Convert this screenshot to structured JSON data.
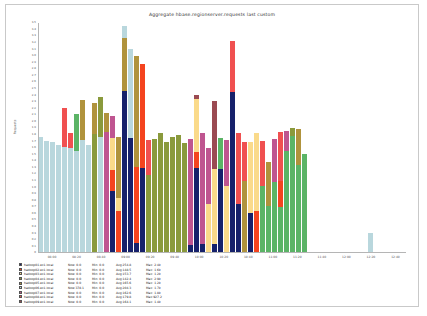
{
  "title": "Aggregate hbase.regionserver.requests last custom",
  "axes": {
    "ylabel": "Requests",
    "ylim": [
      0,
      3500
    ],
    "ytick_step": 100,
    "xticks": [
      "08:00",
      "08:20",
      "08:40",
      "09:00",
      "09:20",
      "09:40",
      "10:00",
      "10:20",
      "10:40",
      "11:00",
      "11:20",
      "11:40",
      "12:00",
      "12:20",
      "12:40"
    ]
  },
  "colors": {
    "navy": "#16216b",
    "orangered": "#f4441f",
    "cream": "#fada8a",
    "olive": "#8a9a3c",
    "khaki": "#b0933c",
    "powderblue": "#b9d7dd",
    "magenta": "#bf5590",
    "red": "#f05050",
    "maroon": "#9b4a52",
    "green": "#5bb466"
  },
  "legend": {
    "columns": [
      "host",
      "now",
      "min",
      "avg",
      "max"
    ],
    "rows": [
      {
        "color": "#16216b",
        "host": "hadoop01.ex1.local",
        "now": "Now:   0.0",
        "min": "Min:   0.0",
        "avg": "Avg:254.8",
        "max": "Max:  2.4k"
      },
      {
        "color": "#f4441f",
        "host": "hadoop02.ex1.local",
        "now": "Now:   0.0",
        "min": "Min:   0.0",
        "avg": "Avg:148.5",
        "max": "Max:  1.6k"
      },
      {
        "color": "#fada8a",
        "host": "hadoop03.ex1.local",
        "now": "Now:   0.0",
        "min": "Min:   0.0",
        "avg": "Avg:153.7",
        "max": "Max:  1.2k"
      },
      {
        "color": "#8a9a3c",
        "host": "hadoop04.ex1.local",
        "now": "Now:   0.0",
        "min": "Min:   0.0",
        "avg": "Avg:142.4",
        "max": "Max:  2.9k"
      },
      {
        "color": "#b0933c",
        "host": "hadoop05.ex1.local",
        "now": "Now:   0.0",
        "min": "Min:   0.0",
        "avg": "Avg:165.6",
        "max": "Max:  1.2k"
      },
      {
        "color": "#b9d7dd",
        "host": "hadoop06.ex1.local",
        "now": "Now:378.1",
        "min": "Min:   0.0",
        "avg": "Avg:204.3",
        "max": "Max:  1.7k"
      },
      {
        "color": "#bf5590",
        "host": "hadoop07.ex1.local",
        "now": "Now:   0.0",
        "min": "Min:   0.0",
        "avg": "Avg:162.6",
        "max": "Max:  1.8k"
      },
      {
        "color": "#f05050",
        "host": "hadoop08.ex1.local",
        "now": "Now:   0.0",
        "min": "Min:   0.0",
        "avg": "Avg:179.8",
        "max": "Max:927.2"
      },
      {
        "color": "#9b4a52",
        "host": "hadoop09.ex1.local",
        "now": "Now:   0.0",
        "min": "Min:   0.0",
        "avg": "Avg:164.1",
        "max": "Max:  1.4k"
      }
    ]
  },
  "chart_data": {
    "type": "bar",
    "stacked": true,
    "title": "Aggregate hbase.regionserver.requests last custom",
    "xlabel": "",
    "ylabel": "Requests",
    "ylim": [
      0,
      3500
    ],
    "grid": true,
    "legend_position": "below",
    "series_names": [
      "hadoop01",
      "hadoop02",
      "hadoop03",
      "hadoop04",
      "hadoop05",
      "hadoop06",
      "hadoop07",
      "hadoop08",
      "hadoop09"
    ],
    "x": [
      "08:00",
      "08:20",
      "08:40",
      "09:00",
      "09:20",
      "09:40",
      "10:00",
      "10:20",
      "10:40",
      "11:00",
      "11:20",
      "11:40",
      "12:00",
      "12:20",
      "12:40"
    ],
    "bars": [
      {
        "x": 0,
        "segments": [
          {
            "color": "#b9d7dd",
            "value": 1760
          }
        ]
      },
      {
        "x": 6,
        "segments": [
          {
            "color": "#b9d7dd",
            "value": 1710
          }
        ]
      },
      {
        "x": 12,
        "segments": [
          {
            "color": "#b9d7dd",
            "value": 1690
          }
        ]
      },
      {
        "x": 18,
        "segments": [
          {
            "color": "#b9d7dd",
            "value": 1640
          }
        ]
      },
      {
        "x": 24,
        "segments": [
          {
            "color": "#b9d7dd",
            "value": 1620
          },
          {
            "color": "#f05050",
            "value": 580
          }
        ]
      },
      {
        "x": 30,
        "segments": [
          {
            "color": "#b9d7dd",
            "value": 1600
          },
          {
            "color": "#f05050",
            "value": 230
          }
        ]
      },
      {
        "x": 36,
        "segments": [
          {
            "color": "#b9d7dd",
            "value": 1560
          },
          {
            "color": "#5bb466",
            "value": 560
          }
        ]
      },
      {
        "x": 42,
        "segments": [
          {
            "color": "#b9d7dd",
            "value": 1720
          },
          {
            "color": "#b0933c",
            "value": 610
          }
        ]
      },
      {
        "x": 48,
        "segments": [
          {
            "color": "#b9d7dd",
            "value": 1640
          }
        ]
      },
      {
        "x": 54,
        "segments": [
          {
            "color": "#8a9a3c",
            "value": 1810
          },
          {
            "color": "#b0933c",
            "value": 480
          }
        ]
      },
      {
        "x": 60,
        "segments": [
          {
            "color": "#b9d7dd",
            "value": 1760
          },
          {
            "color": "#8a9a3c",
            "value": 620
          }
        ]
      },
      {
        "x": 66,
        "segments": [
          {
            "color": "#bf5590",
            "value": 1840
          },
          {
            "color": "#b0933c",
            "value": 290
          }
        ]
      },
      {
        "x": 72,
        "segments": [
          {
            "color": "#16216b",
            "value": 940
          },
          {
            "color": "#f4441f",
            "value": 330
          },
          {
            "color": "#fada8a",
            "value": 480
          },
          {
            "color": "#bf5590",
            "value": 330
          }
        ]
      },
      {
        "x": 78,
        "segments": [
          {
            "color": "#f4441f",
            "value": 640
          },
          {
            "color": "#fada8a",
            "value": 200
          },
          {
            "color": "#b0933c",
            "value": 920
          }
        ]
      },
      {
        "x": 84,
        "segments": [
          {
            "color": "#16216b",
            "value": 2460
          },
          {
            "color": "#b0933c",
            "value": 810
          },
          {
            "color": "#b9d7dd",
            "value": 180
          }
        ]
      },
      {
        "x": 90,
        "segments": [
          {
            "color": "#16216b",
            "value": 1750
          },
          {
            "color": "#b9d7dd",
            "value": 1360
          }
        ]
      },
      {
        "x": 96,
        "segments": [
          {
            "color": "#16216b",
            "value": 150
          },
          {
            "color": "#f4441f",
            "value": 1160
          },
          {
            "color": "#b0933c",
            "value": 1690
          }
        ]
      },
      {
        "x": 102,
        "segments": [
          {
            "color": "#16216b",
            "value": 1300
          },
          {
            "color": "#f4441f",
            "value": 1580
          }
        ]
      },
      {
        "x": 108,
        "segments": [
          {
            "color": "#8a9a3c",
            "value": 1180
          },
          {
            "color": "#f05050",
            "value": 540
          }
        ]
      },
      {
        "x": 114,
        "segments": [
          {
            "color": "#8a9a3c",
            "value": 1740
          }
        ]
      },
      {
        "x": 120,
        "segments": [
          {
            "color": "#8a9a3c",
            "value": 1820
          }
        ]
      },
      {
        "x": 126,
        "segments": [
          {
            "color": "#8a9a3c",
            "value": 1690
          }
        ]
      },
      {
        "x": 132,
        "segments": [
          {
            "color": "#8a9a3c",
            "value": 1760
          }
        ]
      },
      {
        "x": 138,
        "segments": [
          {
            "color": "#8a9a3c",
            "value": 1800
          }
        ]
      },
      {
        "x": 144,
        "segments": [
          {
            "color": "#8a9a3c",
            "value": 1680
          }
        ]
      },
      {
        "x": 150,
        "segments": [
          {
            "color": "#16216b",
            "value": 120
          },
          {
            "color": "#bf5590",
            "value": 1620
          }
        ]
      },
      {
        "x": 156,
        "segments": [
          {
            "color": "#16216b",
            "value": 1290
          },
          {
            "color": "#f4441f",
            "value": 240
          },
          {
            "color": "#fada8a",
            "value": 820
          },
          {
            "color": "#9b4a52",
            "value": 60
          }
        ]
      },
      {
        "x": 162,
        "segments": [
          {
            "color": "#16216b",
            "value": 140
          },
          {
            "color": "#bf5590",
            "value": 1680
          }
        ]
      },
      {
        "x": 168,
        "segments": [
          {
            "color": "#fada8a",
            "value": 740
          },
          {
            "color": "#bf5590",
            "value": 860
          }
        ]
      },
      {
        "x": 174,
        "segments": [
          {
            "color": "#16216b",
            "value": 140
          },
          {
            "color": "#fada8a",
            "value": 1140
          },
          {
            "color": "#9b4a52",
            "value": 1030
          }
        ]
      },
      {
        "x": 180,
        "segments": [
          {
            "color": "#16216b",
            "value": 1280
          },
          {
            "color": "#5bb466",
            "value": 470
          }
        ]
      },
      {
        "x": 186,
        "segments": [
          {
            "color": "#fada8a",
            "value": 1020
          },
          {
            "color": "#bf5590",
            "value": 700
          }
        ]
      },
      {
        "x": 192,
        "segments": [
          {
            "color": "#16216b",
            "value": 2450
          },
          {
            "color": "#f05050",
            "value": 780
          }
        ]
      },
      {
        "x": 198,
        "segments": [
          {
            "color": "#16216b",
            "value": 740
          },
          {
            "color": "#f05050",
            "value": 1090
          }
        ]
      },
      {
        "x": 204,
        "segments": [
          {
            "color": "#b0933c",
            "value": 1100
          },
          {
            "color": "#f05050",
            "value": 590
          }
        ]
      },
      {
        "x": 210,
        "segments": [
          {
            "color": "#16216b",
            "value": 610
          },
          {
            "color": "#fada8a",
            "value": 1080
          }
        ]
      },
      {
        "x": 216,
        "segments": [
          {
            "color": "#f4441f",
            "value": 640
          },
          {
            "color": "#fada8a",
            "value": 1180
          }
        ]
      },
      {
        "x": 222,
        "segments": [
          {
            "color": "#5bb466",
            "value": 1020
          },
          {
            "color": "#f05050",
            "value": 680
          }
        ]
      },
      {
        "x": 228,
        "segments": [
          {
            "color": "#5bb466",
            "value": 720
          },
          {
            "color": "#b0933c",
            "value": 660
          }
        ]
      },
      {
        "x": 234,
        "segments": [
          {
            "color": "#5bb466",
            "value": 1080
          },
          {
            "color": "#bf5590",
            "value": 650
          }
        ]
      },
      {
        "x": 240,
        "segments": [
          {
            "color": "#5bb466",
            "value": 700
          },
          {
            "color": "#f4441f",
            "value": 400
          },
          {
            "color": "#f05050",
            "value": 740
          }
        ]
      },
      {
        "x": 246,
        "segments": [
          {
            "color": "#5bb466",
            "value": 1560
          },
          {
            "color": "#bf5590",
            "value": 290
          }
        ]
      },
      {
        "x": 252,
        "segments": [
          {
            "color": "#5bb466",
            "value": 1780
          },
          {
            "color": "#8a9a3c",
            "value": 120
          }
        ]
      },
      {
        "x": 258,
        "segments": [
          {
            "color": "#5bb466",
            "value": 1340
          },
          {
            "color": "#b0933c",
            "value": 540
          }
        ]
      },
      {
        "x": 264,
        "segments": [
          {
            "color": "#5bb466",
            "value": 1510
          }
        ]
      },
      {
        "x": 330,
        "segments": [
          {
            "color": "#b9d7dd",
            "value": 300
          }
        ]
      }
    ]
  }
}
